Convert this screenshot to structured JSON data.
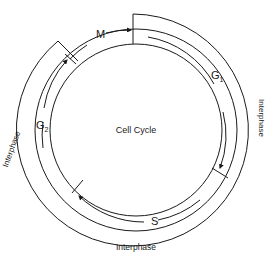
{
  "diagram": {
    "center_label": "Cell Cycle",
    "phases": [
      {
        "id": "M",
        "label": "M"
      },
      {
        "id": "G1",
        "label": "G",
        "subscript": "1"
      },
      {
        "id": "S",
        "label": "S"
      },
      {
        "id": "G2",
        "label": "G",
        "subscript": "2"
      }
    ],
    "interphase_labels": {
      "right": "Interphase",
      "bottom": "Interphase",
      "left": "Interphase"
    },
    "colors": {
      "line": "#1a1a1a",
      "background": "#ffffff"
    }
  }
}
